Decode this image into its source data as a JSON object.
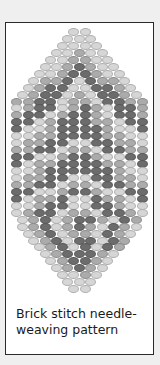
{
  "caption": "Brick stitch needle-weaving pattern",
  "colors": {
    "light": "#d6d6d6",
    "medium": "#ababab",
    "dark": "#6c6c6c",
    "frame_border": "#2a2a2a",
    "background": "#efefef"
  },
  "pattern": {
    "rows": [
      "LL",
      "LLL",
      "LLLL",
      "LLMLL",
      "LLMMLL",
      "LLMDMLL",
      "LLMDDMLL",
      "LMMDLDMML",
      "LMDDLLDDML",
      "LMDDLMLDDML",
      "MMDDLMMLDDMM",
      "LMDDLMDMLDDM",
      "MDDLMDDMLDDM",
      "DDLMDDDMMLDD",
      "DLLMDDDDMLLD",
      "LLMMDDDDMMLL",
      "LMMDDLLDDMML",
      "MMDDLMMLDDMM",
      "DDLLMDDMLLDD",
      "DLMMDDDDMMLD",
      "LLMDDDDDDMLL",
      "LMMDDLLDDMML",
      "MMDDLMMLDDMM",
      "DDLLMDDMLLDD",
      "DLMMDLLDMMLD",
      "LLMDDLLDDMLL",
      "LMDDLMMLDDML",
      "LMDLMDDMLDM",
      "LMDLMDMLDML",
      "LMDLMMLDML",
      "LMDLDDLDM",
      "LMDLDLDM",
      "LMDDDML",
      "LMDDML",
      "LMDML",
      "LLML",
      "LLL",
      "LL"
    ]
  }
}
